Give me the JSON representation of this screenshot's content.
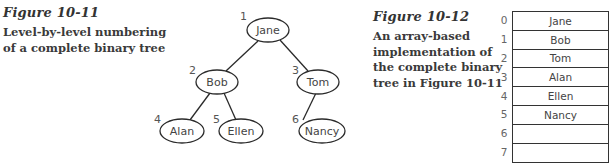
{
  "figure1": {
    "title": "Figure 10-11",
    "caption_lines": [
      "Level-by-level numbering",
      "of a complete binary tree"
    ],
    "tree": {
      "nodes": [
        {
          "number": "1",
          "label": "Jane"
        },
        {
          "number": "2",
          "label": "Bob"
        },
        {
          "number": "3",
          "label": "Tom"
        },
        {
          "number": "4",
          "label": "Alan"
        },
        {
          "number": "5",
          "label": "Ellen"
        },
        {
          "number": "6",
          "label": "Nancy"
        }
      ],
      "edges": [
        [
          "Jane",
          "Bob"
        ],
        [
          "Jane",
          "Tom"
        ],
        [
          "Bob",
          "Alan"
        ],
        [
          "Bob",
          "Ellen"
        ],
        [
          "Tom",
          "Nancy"
        ]
      ]
    }
  },
  "figure2": {
    "title": "Figure 10-12",
    "caption_lines": [
      "An array-based",
      "implementation of",
      "the complete binary",
      "tree in Figure 10-11"
    ],
    "array": {
      "rows": [
        {
          "index": "0",
          "value": "Jane"
        },
        {
          "index": "1",
          "value": "Bob"
        },
        {
          "index": "2",
          "value": "Tom"
        },
        {
          "index": "3",
          "value": "Alan"
        },
        {
          "index": "4",
          "value": "Ellen"
        },
        {
          "index": "5",
          "value": "Nancy"
        },
        {
          "index": "6",
          "value": ""
        },
        {
          "index": "7",
          "value": ""
        }
      ]
    }
  }
}
